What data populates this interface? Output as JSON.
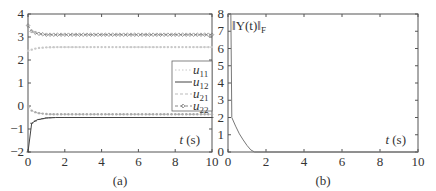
{
  "chart_data": [
    {
      "type": "line",
      "panel_label": "(a)",
      "title": "",
      "xlabel": "t (s)",
      "ylabel": "",
      "xlim": [
        0,
        10
      ],
      "ylim": [
        -2,
        4
      ],
      "xticks": [
        0,
        2,
        4,
        6,
        8,
        10
      ],
      "yticks": [
        -2,
        -1,
        0,
        1,
        2,
        3,
        4
      ],
      "legend": {
        "position": "right-middle",
        "entries": [
          "u11",
          "u12",
          "u21",
          "u22"
        ]
      },
      "series": [
        {
          "name": "u11",
          "style": "dotted-light",
          "x": [
            0,
            0.2,
            0.5,
            1,
            1.5,
            2,
            10
          ],
          "values": [
            2.4,
            2.45,
            2.52,
            2.55,
            2.56,
            2.56,
            2.56
          ]
        },
        {
          "name": "u12",
          "style": "solid-dark",
          "x": [
            0,
            0.2,
            0.5,
            1,
            1.5,
            2,
            10
          ],
          "values": [
            -2.0,
            -0.75,
            -0.6,
            -0.52,
            -0.5,
            -0.5,
            -0.5
          ]
        },
        {
          "name": "u21",
          "style": "dashed-light",
          "x": [
            0,
            0.2,
            0.5,
            1,
            1.5,
            2,
            10
          ],
          "values": [
            0.0,
            -0.2,
            -0.3,
            -0.35,
            -0.36,
            -0.36,
            -0.36
          ]
        },
        {
          "name": "u22",
          "style": "dash-diamond",
          "x": [
            0,
            0.2,
            0.5,
            1,
            1.5,
            2,
            10
          ],
          "values": [
            3.5,
            3.25,
            3.15,
            3.1,
            3.1,
            3.1,
            3.1
          ]
        }
      ]
    },
    {
      "type": "line",
      "panel_label": "(b)",
      "title": "",
      "xlabel": "t (s)",
      "ylabel": "",
      "annotation": "||Y(t)||_F",
      "xlim": [
        0,
        10
      ],
      "ylim": [
        0,
        8
      ],
      "xticks": [
        0,
        2,
        4,
        6,
        8,
        10
      ],
      "yticks": [
        0,
        1,
        2,
        3,
        4,
        5,
        6,
        7,
        8
      ],
      "series": [
        {
          "name": "||Y(t)||_F",
          "x": [
            0,
            0.15,
            0.2,
            0.4,
            0.6,
            0.8,
            1.0,
            1.2,
            1.4,
            10
          ],
          "values": [
            8,
            8,
            2.0,
            1.5,
            1.05,
            0.7,
            0.38,
            0.12,
            0,
            0
          ]
        }
      ]
    }
  ],
  "labels": {
    "a": {
      "xlabel_t": "t",
      "xlabel_unit": " (s)",
      "caption": "(a)",
      "legend": [
        "u",
        "u",
        "u",
        "u"
      ],
      "legend_sub": [
        "11",
        "12",
        "21",
        "22"
      ]
    },
    "b": {
      "xlabel_t": "t",
      "xlabel_unit": " (s)",
      "caption": "(b)",
      "annotation_main": "‖Y(t)‖",
      "annotation_sub": "F"
    }
  }
}
